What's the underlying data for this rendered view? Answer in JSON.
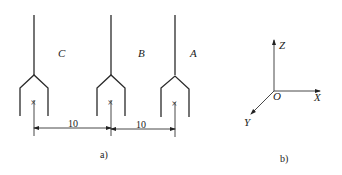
{
  "figure_a": {
    "caption": "a)",
    "conductors": [
      {
        "label": "C",
        "x": 34
      },
      {
        "label": "B",
        "x": 111
      },
      {
        "label": "A",
        "x": 175
      }
    ],
    "dimensions": [
      {
        "value": "10",
        "from": "C",
        "to": "B"
      },
      {
        "value": "10",
        "from": "B",
        "to": "A"
      }
    ]
  },
  "figure_b": {
    "caption": "b)",
    "axes": {
      "x_label": "X",
      "y_label": "Y",
      "z_label": "Z",
      "origin_label": "O"
    }
  }
}
